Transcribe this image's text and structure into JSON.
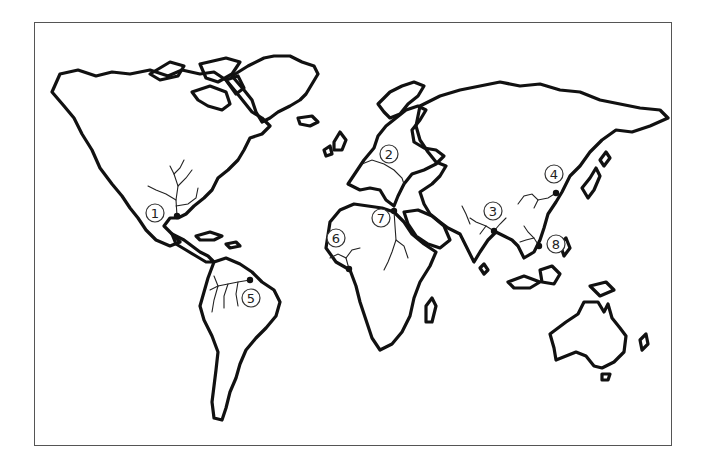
{
  "map": {
    "type": "world outline map",
    "frame": {
      "left": 34,
      "top": 22,
      "right": 672,
      "bottom": 446
    },
    "colors": {
      "land_outline": "#111111",
      "background": "#ffffff",
      "frame": "#555555"
    },
    "markers": [
      {
        "id": 1,
        "label": "1",
        "x": 155,
        "y": 213,
        "dot": [
          177,
          216
        ],
        "region": "North America (Mississippi delta)"
      },
      {
        "id": 2,
        "label": "2",
        "x": 389,
        "y": 154,
        "dot": null,
        "region": "Europe (Danube)"
      },
      {
        "id": 3,
        "label": "3",
        "x": 493,
        "y": 211,
        "dot": [
          494,
          231
        ],
        "region": "South Asia (Ganges delta)"
      },
      {
        "id": 4,
        "label": "4",
        "x": 554,
        "y": 174,
        "dot": [
          556,
          193
        ],
        "region": "East Asia (Yangtze)"
      },
      {
        "id": 5,
        "label": "5",
        "x": 251,
        "y": 298,
        "dot": [
          250,
          280
        ],
        "region": "South America (Amazon)"
      },
      {
        "id": 6,
        "label": "6",
        "x": 336,
        "y": 238,
        "dot": [
          349,
          269
        ],
        "region": "West Africa (Niger delta)"
      },
      {
        "id": 7,
        "label": "7",
        "x": 381,
        "y": 218,
        "dot": [
          394,
          211
        ],
        "region": "North Africa (Nile delta)"
      },
      {
        "id": 8,
        "label": "8",
        "x": 556,
        "y": 244,
        "dot": [
          539,
          246
        ],
        "region": "Southeast Asia (Mekong/Pearl)"
      }
    ]
  }
}
